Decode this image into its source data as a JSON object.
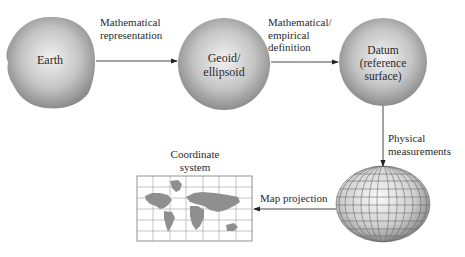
{
  "nodes": {
    "earth": {
      "label": "Earth"
    },
    "geoid": {
      "label_line1": "Geoid/",
      "label_line2": "ellipsoid"
    },
    "datum": {
      "label_line1": "Datum",
      "label_line2": "(reference",
      "label_line3": "surface)"
    },
    "globe": {
      "label": ""
    },
    "map": {
      "title_line1": "Coordinate",
      "title_line2": "system"
    }
  },
  "edges": {
    "earth_to_geoid": {
      "line1": "Mathematical",
      "line2": "representation"
    },
    "geoid_to_datum": {
      "line1": "Mathematical/",
      "line2": "empirical",
      "line3": "definition"
    },
    "datum_to_globe": {
      "line1": "Physical",
      "line2": "measurements"
    },
    "globe_to_map": {
      "line1": "Map projection"
    }
  },
  "colors": {
    "sphere_light": "#eeeeee",
    "sphere_dark": "#8a8a8a",
    "line": "#333333",
    "land": "#8f8f8f"
  }
}
